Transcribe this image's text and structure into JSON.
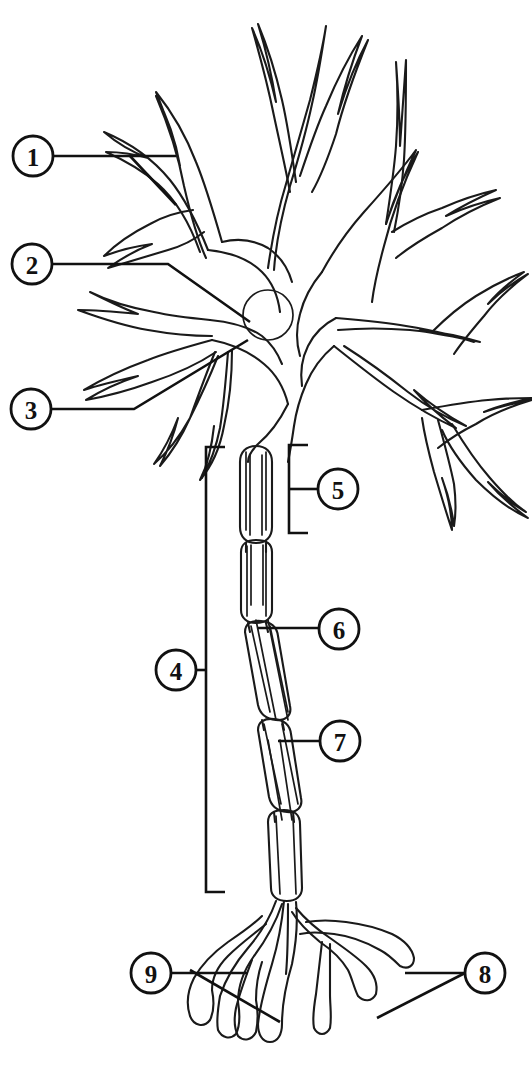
{
  "diagram": {
    "background_color": "#ffffff",
    "line_color": "#1a1a1a",
    "width": 532,
    "height": 1068,
    "style": "black and white line drawing, unlabeled worksheet"
  },
  "callouts": [
    {
      "id": "1",
      "label": "1",
      "cx": 33,
      "cy": 156,
      "r": 20,
      "points_to": "dendrite-upper-left"
    },
    {
      "id": "2",
      "label": "2",
      "cx": 32,
      "cy": 264,
      "r": 20,
      "points_to": "nucleus"
    },
    {
      "id": "3",
      "label": "3",
      "cx": 31,
      "cy": 409,
      "r": 20,
      "points_to": "axon-hillock"
    },
    {
      "id": "4",
      "label": "4",
      "cx": 176,
      "cy": 670,
      "r": 20,
      "points_to": "axon"
    },
    {
      "id": "5",
      "label": "5",
      "cx": 338,
      "cy": 489,
      "r": 20,
      "points_to": "myelin-sheath"
    },
    {
      "id": "6",
      "label": "6",
      "cx": 339,
      "cy": 629,
      "r": 20,
      "points_to": "node-of-ranvier"
    },
    {
      "id": "7",
      "label": "7",
      "cx": 340,
      "cy": 741,
      "r": 20,
      "points_to": "schwann-cell"
    },
    {
      "id": "8",
      "label": "8",
      "cx": 485,
      "cy": 973,
      "r": 20,
      "points_to": "axon-terminal"
    },
    {
      "id": "9",
      "label": "9",
      "cx": 151,
      "cy": 973,
      "r": 20,
      "points_to": "synaptic-end-bulb"
    }
  ],
  "parts": {
    "soma": "cell body",
    "nucleus": "nucleus",
    "dendrites": "dendrites",
    "axon": "axon",
    "myelin": "myelin sheath",
    "node": "node of Ranvier",
    "terminals": "axon terminals"
  },
  "brackets": [
    {
      "name": "myelin-bracket",
      "x": 289,
      "y_top": 445,
      "y_bottom": 533,
      "arm": 19,
      "side": "left"
    },
    {
      "name": "axon-bracket",
      "x": 206,
      "y_top": 447,
      "y_bottom": 892,
      "arm": 19,
      "side": "right"
    }
  ]
}
